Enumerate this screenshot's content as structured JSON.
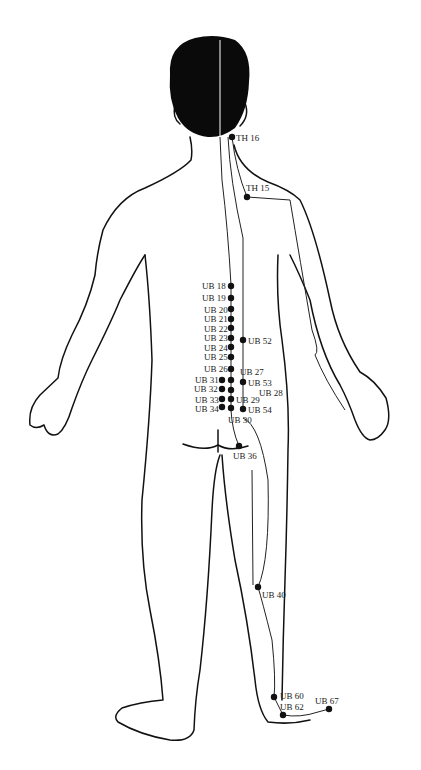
{
  "figure": {
    "colors": {
      "line": "#111111",
      "hair": "#0a0a0a",
      "background": "#ffffff"
    }
  },
  "points": [
    {
      "id": "TH16",
      "label": "TH 16",
      "x": 232,
      "y": 137,
      "lx": 236,
      "ly": 133
    },
    {
      "id": "TH15",
      "label": "TH 15",
      "x": 247,
      "y": 197,
      "lx": 246,
      "ly": 183
    },
    {
      "id": "UB18",
      "label": "UB 18",
      "x": 231,
      "y": 286,
      "lx": 202,
      "ly": 281
    },
    {
      "id": "UB19",
      "label": "UB 19",
      "x": 231,
      "y": 298,
      "lx": 202,
      "ly": 293
    },
    {
      "id": "UB20",
      "label": "UB 20",
      "x": 231,
      "y": 309,
      "lx": 204,
      "ly": 305
    },
    {
      "id": "UB21",
      "label": "UB 21",
      "x": 231,
      "y": 319,
      "lx": 204,
      "ly": 314
    },
    {
      "id": "UB22",
      "label": "UB 22",
      "x": 231,
      "y": 328,
      "lx": 204,
      "ly": 324
    },
    {
      "id": "UB23",
      "label": "UB 23",
      "x": 231,
      "y": 338,
      "lx": 204,
      "ly": 333
    },
    {
      "id": "UB24",
      "label": "UB 24",
      "x": 231,
      "y": 347,
      "lx": 204,
      "ly": 343
    },
    {
      "id": "UB25",
      "label": "UB 25",
      "x": 231,
      "y": 357,
      "lx": 204,
      "ly": 352
    },
    {
      "id": "UB26",
      "label": "UB 26",
      "x": 231,
      "y": 369,
      "lx": 204,
      "ly": 364
    },
    {
      "id": "UB52",
      "label": "UB 52",
      "x": 243,
      "y": 340,
      "lx": 248,
      "ly": 336
    },
    {
      "id": "UB27",
      "label": "UB 27",
      "x": 231,
      "y": 380,
      "lx": 240,
      "ly": 367
    },
    {
      "id": "UB31",
      "label": "UB 31",
      "x": 222,
      "y": 380,
      "lx": 195,
      "ly": 375
    },
    {
      "id": "UB32",
      "label": "UB 32",
      "x": 222,
      "y": 389,
      "lx": 194,
      "ly": 384
    },
    {
      "id": "UB33",
      "label": "UB 33",
      "x": 222,
      "y": 399,
      "lx": 195,
      "ly": 395
    },
    {
      "id": "UB34",
      "label": "UB 34",
      "x": 222,
      "y": 407,
      "lx": 195,
      "ly": 404
    },
    {
      "id": "UB53",
      "label": "UB 53",
      "x": 243,
      "y": 382,
      "lx": 248,
      "ly": 378
    },
    {
      "id": "UB28",
      "label": "UB 28",
      "x": 231,
      "y": 390,
      "lx": 259,
      "ly": 388
    },
    {
      "id": "UB29",
      "label": "UB 29",
      "x": 231,
      "y": 399,
      "lx": 236,
      "ly": 395
    },
    {
      "id": "UB54",
      "label": "UB 54",
      "x": 243,
      "y": 409,
      "lx": 248,
      "ly": 405
    },
    {
      "id": "UB30",
      "label": "UB 30",
      "x": 231,
      "y": 408,
      "lx": 228,
      "ly": 415
    },
    {
      "id": "UB36",
      "label": "UB 36",
      "x": 239,
      "y": 446,
      "lx": 233,
      "ly": 451
    },
    {
      "id": "UB40",
      "label": "UB 40",
      "x": 258,
      "y": 587,
      "lx": 262,
      "ly": 590
    },
    {
      "id": "UB60",
      "label": "UB 60",
      "x": 274,
      "y": 697,
      "lx": 280,
      "ly": 691
    },
    {
      "id": "UB62",
      "label": "UB 62",
      "x": 283,
      "y": 715,
      "lx": 280,
      "ly": 702
    },
    {
      "id": "UB67",
      "label": "UB 67",
      "x": 329,
      "y": 709,
      "lx": 315,
      "ly": 696
    }
  ]
}
